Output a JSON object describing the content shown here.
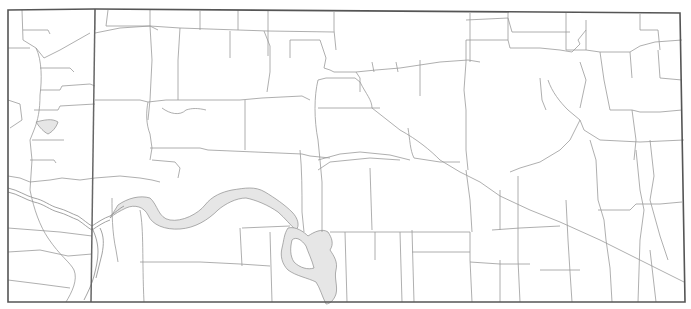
{
  "map": {
    "type": "outline-map",
    "labels": [],
    "features": [
      {
        "kind": "map-frame",
        "name": "map-border"
      },
      {
        "kind": "boundary",
        "name": "county-line-west"
      },
      {
        "kind": "road-network",
        "name": "roads"
      },
      {
        "kind": "river",
        "name": "river"
      },
      {
        "kind": "reservoir",
        "name": "reservoir"
      }
    ],
    "colors": {
      "background": "#ffffff",
      "border": "#555555",
      "boundary": "#666666",
      "road": "#9a9a9a",
      "water_fill": "#e6e6e6",
      "water_outline": "#8c8c8c"
    }
  }
}
